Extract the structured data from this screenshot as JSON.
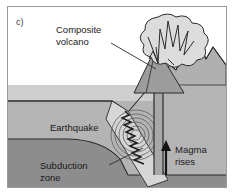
{
  "figure": {
    "panel_label": "c)",
    "type": "geological cross-section diagram",
    "labels": {
      "composite_volcano_line1": "Composite",
      "composite_volcano_line2": "volcano",
      "earthquake": "Earthquake",
      "subduction_line1": "Subduction",
      "subduction_line2": "zone",
      "magma_line1": "Magma",
      "magma_line2": "rises"
    },
    "icons": {
      "magma_arrow": "up-arrow-icon",
      "eruption": "eruption-cloud-icon",
      "seismic": "seismic-waves-icon",
      "fault": "zigzag-fault-icon"
    },
    "colors": {
      "sky": "#ffffff",
      "water": "#cfcfcf",
      "upper_crust": "#b4b4b4",
      "lower_mantle": "#8d8d8d",
      "slab": "#d6d6d6",
      "volcano_cone": "#9c9c9c",
      "eruption_cloud": "#dcdcdc",
      "outline": "#2b2b2b",
      "border": "#9a9a9a",
      "text": "#1a1a1a"
    }
  }
}
